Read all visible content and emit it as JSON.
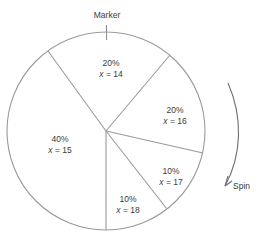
{
  "figure": {
    "type": "spinner-pie-diagram",
    "marker_label": "Marker",
    "spin_label": "Spin",
    "colors": {
      "line": "#9a9a9a",
      "text": "#3a3a3a",
      "background": "#ffffff"
    }
  },
  "chart_data": {
    "type": "pie",
    "title": "",
    "xlabel": "",
    "ylabel": "",
    "categories": [
      "x = 14",
      "x = 16",
      "x = 17",
      "x = 18",
      "x = 15"
    ],
    "values": [
      20,
      20,
      10,
      10,
      40
    ],
    "unit": "%",
    "legend_position": "none",
    "grid": false,
    "annotations": [
      "Marker",
      "Spin"
    ],
    "slices": [
      {
        "percent_label": "20%",
        "value_label": "x = 14",
        "variable": "x",
        "value": 14,
        "percent": 20,
        "label_x": 111,
        "label_y": 69
      },
      {
        "percent_label": "20%",
        "value_label": "x = 16",
        "variable": "x",
        "value": 16,
        "percent": 20,
        "label_x": 175,
        "label_y": 116
      },
      {
        "percent_label": "10%",
        "value_label": "x = 17",
        "variable": "x",
        "value": 17,
        "percent": 10,
        "label_x": 171,
        "label_y": 177
      },
      {
        "percent_label": "10%",
        "value_label": "x = 18",
        "variable": "x",
        "value": 18,
        "percent": 10,
        "label_x": 128,
        "label_y": 205
      },
      {
        "percent_label": "40%",
        "value_label": "x = 15",
        "variable": "x",
        "value": 15,
        "percent": 40,
        "label_x": 60,
        "label_y": 145
      }
    ]
  }
}
